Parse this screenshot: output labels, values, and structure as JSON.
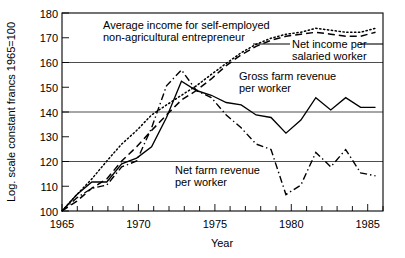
{
  "chart_data": {
    "type": "line",
    "title": "",
    "xlabel": "Year",
    "ylabel": "Log. scale constant francs 1965=100",
    "xlim": [
      1965,
      1986.5
    ],
    "ylim": [
      100,
      180
    ],
    "y_scale": "log",
    "grid": "horizontal",
    "legend_position": "inline-annotations",
    "y_ticks": [
      100,
      110,
      120,
      130,
      140,
      150,
      160,
      170,
      180
    ],
    "y_gridlines": [
      100,
      120,
      140,
      160,
      180
    ],
    "y_tick_labels": [
      "100",
      "110",
      "120",
      "130",
      "140",
      "150",
      "160",
      "170",
      "180"
    ],
    "x_ticks": [
      1965,
      1966,
      1967,
      1968,
      1969,
      1970,
      1971,
      1972,
      1973,
      1974,
      1975,
      1976,
      1977,
      1978,
      1979,
      1980,
      1981,
      1982,
      1983,
      1984,
      1985,
      1986
    ],
    "x_tick_labels": [
      {
        "x": 1965,
        "label": "1965"
      },
      {
        "x": 1970,
        "label": "1970"
      },
      {
        "x": 1975,
        "label": "1975"
      },
      {
        "x": 1980,
        "label": "1980"
      },
      {
        "x": 1985,
        "label": "1985"
      }
    ],
    "series": [
      {
        "name": "Average income for self-employed non-agricultural entrepreneur",
        "style": "dotted",
        "x": [
          1965,
          1966,
          1967,
          1968,
          1969,
          1970,
          1971,
          1972,
          1973,
          1974,
          1975,
          1976,
          1977,
          1978,
          1979,
          1980,
          1981,
          1982,
          1983,
          1984,
          1985,
          1986
        ],
        "values": [
          100,
          105,
          110,
          116,
          122,
          127,
          133,
          137,
          141,
          145,
          150,
          155,
          160,
          164,
          167,
          169,
          170,
          172,
          171,
          170,
          170,
          172
        ]
      },
      {
        "name": "Net income per salaried worker",
        "style": "dashed",
        "x": [
          1965,
          1966,
          1967,
          1968,
          1969,
          1970,
          1971,
          1972,
          1973,
          1974,
          1975,
          1976,
          1977,
          1978,
          1979,
          1980,
          1981,
          1982,
          1983,
          1984,
          1985,
          1986
        ],
        "values": [
          100,
          103,
          107,
          110,
          116,
          121,
          127,
          133,
          139,
          143,
          148,
          154,
          159,
          163,
          166,
          168,
          169,
          170,
          169,
          168,
          168,
          170
        ]
      },
      {
        "name": "Gross farm revenue per worker",
        "style": "solid",
        "x": [
          1965,
          1966,
          1967,
          1968,
          1969,
          1970,
          1971,
          1972,
          1973,
          1974,
          1975,
          1976,
          1977,
          1978,
          1979,
          1980,
          1981,
          1982,
          1983,
          1984,
          1985,
          1986
        ],
        "values": [
          100,
          105,
          109,
          109,
          115,
          117,
          121,
          132,
          147,
          143,
          141,
          138,
          137,
          133,
          132,
          126,
          131,
          140,
          135,
          140,
          136,
          136
        ]
      },
      {
        "name": "Net farm revenue per worker",
        "style": "dash-dot",
        "x": [
          1965,
          1966,
          1967,
          1968,
          1969,
          1970,
          1971,
          1972,
          1973,
          1974,
          1975,
          1976,
          1977,
          1978,
          1979,
          1980,
          1981,
          1982,
          1983,
          1984,
          1985,
          1986
        ],
        "values": [
          100,
          104,
          107,
          108,
          114,
          116,
          128,
          145,
          152,
          143,
          140,
          133,
          128,
          122,
          120,
          105,
          108,
          119,
          114,
          120,
          112,
          111
        ]
      }
    ],
    "annotations": [
      {
        "id": "ann-self-employed",
        "text_line1": "Average income for self-employed",
        "text_line2": "non-agricultural entrepreneur"
      },
      {
        "id": "ann-salaried",
        "text_line1": "Net income per",
        "text_line2": "salaried worker"
      },
      {
        "id": "ann-gross-farm",
        "text_line1": "Gross farm revenue",
        "text_line2": "per worker"
      },
      {
        "id": "ann-net-farm",
        "text_line1": "Net farm revenue",
        "text_line2": "per worker"
      }
    ]
  }
}
